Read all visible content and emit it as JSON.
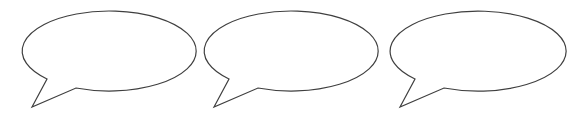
{
  "canvas": {
    "width": 583,
    "height": 117,
    "background": "#ffffff",
    "stroke_color": "#3f3f3f"
  },
  "bubbles": [
    {
      "id": "bubble-1",
      "text": "",
      "cx": 108,
      "cy": 50,
      "rx": 87,
      "ry": 40,
      "tail": [
        [
          47,
          79
        ],
        [
          32,
          107
        ],
        [
          76,
          88
        ]
      ]
    },
    {
      "id": "bubble-2",
      "text": "",
      "cx": 290,
      "cy": 50,
      "rx": 87,
      "ry": 40,
      "tail": [
        [
          229,
          79
        ],
        [
          214,
          107
        ],
        [
          258,
          88
        ]
      ]
    },
    {
      "id": "bubble-3",
      "text": "",
      "cx": 476,
      "cy": 50,
      "rx": 88,
      "ry": 40,
      "tail": [
        [
          415,
          79
        ],
        [
          400,
          107
        ],
        [
          444,
          88
        ]
      ]
    }
  ]
}
